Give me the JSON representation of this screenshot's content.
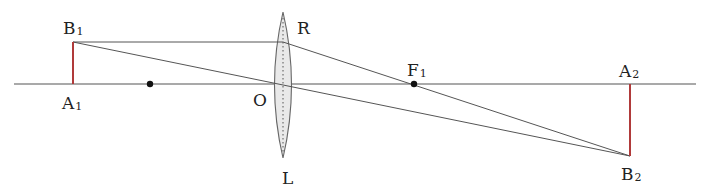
{
  "diagram": {
    "type": "thin converging lens ray diagram",
    "colors": {
      "line": "#555555",
      "object": "#b03a3a",
      "lens_fill": "#e8e8e8",
      "lens_stroke": "#666666",
      "dot": "#111111"
    },
    "labels": {
      "B1": {
        "main": "B",
        "sub": "1"
      },
      "A1": {
        "main": "A",
        "sub": "1"
      },
      "R": {
        "main": "R",
        "sub": ""
      },
      "O": {
        "main": "O",
        "sub": ""
      },
      "L": {
        "main": "L",
        "sub": ""
      },
      "F1": {
        "main": "F",
        "sub": "1"
      },
      "A2": {
        "main": "A",
        "sub": "2"
      },
      "B2": {
        "main": "B",
        "sub": "2"
      }
    },
    "points": {
      "A1": [
        73,
        84
      ],
      "B1": [
        73,
        42
      ],
      "F_left": [
        150,
        84
      ],
      "O": [
        283,
        84
      ],
      "R": [
        283,
        42
      ],
      "F1": [
        414,
        84
      ],
      "A2": [
        630,
        84
      ],
      "B2": [
        630,
        156
      ]
    },
    "axis": {
      "x1": 14,
      "x2": 696,
      "y": 84
    },
    "lens": {
      "cx": 283,
      "top": 12,
      "bottom": 158,
      "half_width": 13
    }
  }
}
